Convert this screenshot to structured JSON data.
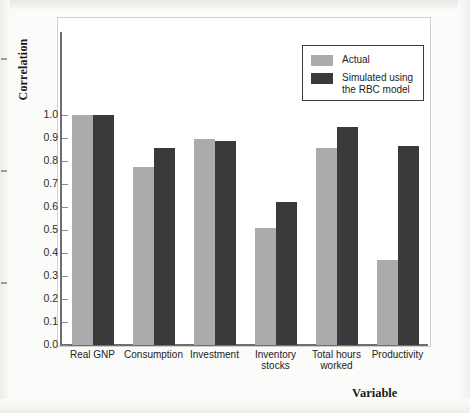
{
  "chart_data": {
    "type": "bar",
    "title": "",
    "xlabel": "Variable",
    "ylabel": "Correlation",
    "ylim": [
      0.0,
      1.0
    ],
    "grid": false,
    "legend_position": "top-right",
    "categories": [
      "Real GNP",
      "Consumption",
      "Investment",
      "Inventory\nstocks",
      "Total hours\nworked",
      "Productivity"
    ],
    "ytick_labels": [
      "1.0",
      "0.9",
      "0.8",
      "0.7",
      "0.6",
      "0.5",
      "0.4",
      "0.3",
      "0.2",
      "0.1",
      "0.0"
    ],
    "ytick_values": [
      1.0,
      0.9,
      0.8,
      0.7,
      0.6,
      0.5,
      0.4,
      0.3,
      0.2,
      0.1,
      0.0
    ],
    "series": [
      {
        "name": "Actual",
        "color": "#ababab",
        "values": [
          1.0,
          0.775,
          0.895,
          0.51,
          0.855,
          0.37
        ]
      },
      {
        "name": "Simulated using\nthe RBC model",
        "color": "#3a3a3a",
        "values": [
          1.0,
          0.855,
          0.885,
          0.62,
          0.95,
          0.865
        ]
      }
    ]
  },
  "legend": {
    "entries": [
      {
        "label": "Actual",
        "swatch": "actual"
      },
      {
        "label": "Simulated using\nthe RBC model",
        "swatch": "simulated"
      }
    ]
  },
  "axes": {
    "y_title": "Correlation",
    "x_title": "Variable"
  },
  "colors": {
    "actual": "#ababab",
    "simulated": "#3a3a3a",
    "axis": "#6e6e6e",
    "frame": "#cfcfcc",
    "text": "#1e1e1e",
    "page_background": "#fbfbfa"
  }
}
